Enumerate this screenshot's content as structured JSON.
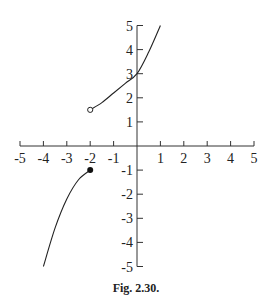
{
  "figure": {
    "caption": "Fig. 2.30."
  },
  "chart_data": {
    "type": "line",
    "title": "",
    "caption": "Fig. 2.30.",
    "xlabel": "",
    "ylabel": "",
    "xlim": [
      -5,
      5
    ],
    "ylim": [
      -5,
      5
    ],
    "grid": false,
    "legend": null,
    "x_ticks": [
      -5,
      -4,
      -3,
      -2,
      -1,
      1,
      2,
      3,
      4,
      5
    ],
    "y_ticks": [
      -5,
      -4,
      -3,
      -2,
      -1,
      1,
      2,
      3,
      4,
      5
    ],
    "x_tick_labels": [
      "-5",
      "-4",
      "-3",
      "-2",
      "-1",
      "1",
      "2",
      "3",
      "4",
      "5"
    ],
    "y_tick_labels": [
      "-5",
      "-4",
      "-3",
      "-2",
      "-1",
      "1",
      "2",
      "3",
      "4",
      "5"
    ],
    "series": [
      {
        "name": "upper branch",
        "x": [
          -2,
          -1.5,
          -1,
          -0.5,
          0,
          0.5,
          1
        ],
        "y": [
          1.5,
          1.8,
          2.2,
          2.6,
          3.0,
          3.9,
          5.0
        ],
        "start_marker": "open-circle",
        "start_point": [
          -2,
          1.5
        ],
        "end_point": [
          1,
          5
        ]
      },
      {
        "name": "lower branch",
        "x": [
          -4,
          -3.5,
          -3,
          -2.5,
          -2
        ],
        "y": [
          -5,
          -3.4,
          -2.2,
          -1.4,
          -1
        ],
        "end_marker": "closed-dot",
        "end_point": [
          -2,
          -1
        ],
        "start_point": [
          -4,
          -5
        ]
      }
    ],
    "annotations": [
      {
        "type": "open-circle",
        "at": [
          -2,
          1.5
        ]
      },
      {
        "type": "closed-dot",
        "at": [
          -2,
          -1
        ]
      }
    ]
  },
  "colors": {
    "ink": "#222222",
    "background": "#ffffff"
  }
}
